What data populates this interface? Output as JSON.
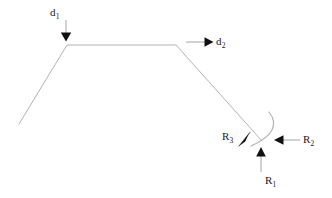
{
  "figure": {
    "type": "free-body-diagram",
    "background_color": "#ffffff",
    "body_stroke_color": "#b0b0b0",
    "arrow_color": "#1a1a1a",
    "text_color": "#1a1a1a"
  },
  "labels": {
    "d1": {
      "base": "d",
      "sub": "1",
      "full": "d1",
      "x": 50,
      "y": 7
    },
    "d2": {
      "base": "d",
      "sub": "2",
      "full": "d2",
      "x": 216,
      "y": 36
    },
    "r1": {
      "base": "R",
      "sub": "1",
      "full": "R1",
      "x": 265,
      "y": 175
    },
    "r2": {
      "base": "R",
      "sub": "2",
      "full": "R2",
      "x": 303,
      "y": 134
    },
    "r3": {
      "base": "R",
      "sub": "3",
      "full": "R3",
      "x": 222,
      "y": 131
    }
  },
  "body_outline": {
    "name": "beam-profile-polyline",
    "points": [
      {
        "x": 19,
        "y": 124
      },
      {
        "x": 67,
        "y": 45
      },
      {
        "x": 176,
        "y": 45
      },
      {
        "x": 262,
        "y": 141
      }
    ]
  },
  "support_arc": {
    "name": "curved-support-arc",
    "start": {
      "x": 269,
      "y": 112
    },
    "control": {
      "x": 283,
      "y": 132
    },
    "end": {
      "x": 251,
      "y": 146
    }
  },
  "force_arrows": [
    {
      "id": "d1",
      "name": "load-arrow-d1",
      "direction": "down",
      "tail": {
        "x": 66,
        "y": 20
      },
      "head": {
        "x": 66,
        "y": 41
      }
    },
    {
      "id": "d2",
      "name": "load-arrow-d2",
      "direction": "right",
      "tail": {
        "x": 186,
        "y": 42
      },
      "head": {
        "x": 213,
        "y": 42
      }
    },
    {
      "id": "r1",
      "name": "reaction-arrow-r1",
      "direction": "up",
      "tail": {
        "x": 261,
        "y": 172
      },
      "head": {
        "x": 261,
        "y": 147
      }
    },
    {
      "id": "r2",
      "name": "reaction-arrow-r2",
      "direction": "left",
      "tail": {
        "x": 300,
        "y": 140
      },
      "head": {
        "x": 274,
        "y": 140
      }
    },
    {
      "id": "r3",
      "name": "reaction-arrow-r3",
      "direction": "down-left",
      "tail": {
        "x": 252,
        "y": 134
      },
      "head": {
        "x": 239,
        "y": 146
      }
    }
  ]
}
